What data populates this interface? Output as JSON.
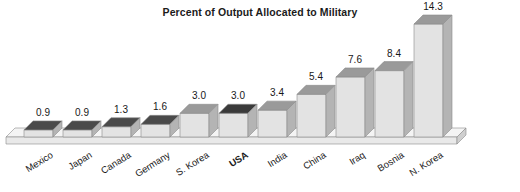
{
  "chart_data": {
    "type": "bar",
    "title": "Percent of Output Allocated to Military",
    "xlabel": "",
    "ylabel": "",
    "ylim": [
      0,
      14.3
    ],
    "grid": false,
    "legend": "none",
    "three_d": true,
    "categories": [
      "Mexico",
      "Japan",
      "Canada",
      "Germany",
      "S. Korea",
      "USA",
      "India",
      "China",
      "Iraq",
      "Bosnia",
      "N. Korea"
    ],
    "values": [
      0.9,
      0.9,
      1.3,
      1.6,
      3.0,
      3.0,
      3.4,
      5.4,
      7.6,
      8.4,
      14.3
    ],
    "value_labels": [
      "0.9",
      "0.9",
      "1.3",
      "1.6",
      "3.0",
      "3.0",
      "3.4",
      "5.4",
      "7.6",
      "8.4",
      "14.3"
    ],
    "highlighted_category": "USA",
    "colors": {
      "bar_front": "#e3e3e3",
      "bar_top": "#9a9a9a",
      "bar_top_dark": "#4a4a4a",
      "bar_top_highlight": "#3a3a3a",
      "bar_side": "#b4b4b4",
      "floor": "#e9e9e9",
      "floor_top": "#f4f4f4",
      "outline": "#8c8c8c",
      "text": "#181818",
      "background": "#ffffff"
    }
  },
  "title": {
    "text": "Percent of Output Allocated to Military"
  },
  "axis": {
    "category_labels": [
      "Mexico",
      "Japan",
      "Canada",
      "Germany",
      "S. Korea",
      "USA",
      "India",
      "China",
      "Iraq",
      "Bosnia",
      "N. Korea"
    ]
  },
  "labels": {
    "v0": "0.9",
    "v1": "0.9",
    "v2": "1.3",
    "v3": "1.6",
    "v4": "3.0",
    "v5": "3.0",
    "v6": "3.4",
    "v7": "5.4",
    "v8": "7.6",
    "v9": "8.4",
    "v10": "14.3",
    "c0": "Mexico",
    "c1": "Japan",
    "c2": "Canada",
    "c3": "Germany",
    "c4": "S. Korea",
    "c5": "USA",
    "c6": "India",
    "c7": "China",
    "c8": "Iraq",
    "c9": "Bosnia",
    "c10": "N. Korea"
  }
}
